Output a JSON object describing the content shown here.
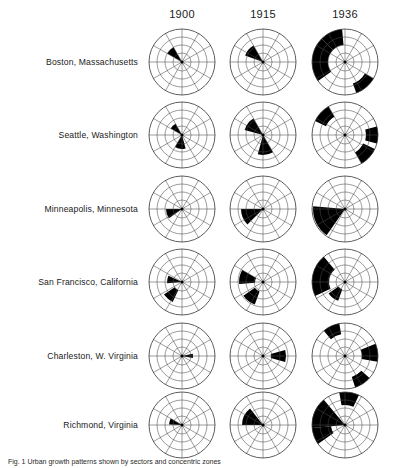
{
  "figure": {
    "title": "",
    "caption": "Fig. 1 Urban growth patterns shown by sectors and concentric zones"
  },
  "columns": [
    {
      "label": "1900",
      "cx": 182
    },
    {
      "label": "1915",
      "cx": 263
    },
    {
      "label": "1936",
      "cx": 345
    }
  ],
  "rows": [
    {
      "label": "Boston, Massachusetts",
      "cy": 62
    },
    {
      "label": "Seattle, Washington",
      "cy": 135
    },
    {
      "label": "Minneapolis, Minnesota",
      "cy": 209
    },
    {
      "label": "San Francisco, California",
      "cy": 282
    },
    {
      "label": "Charleston, W. Virginia",
      "cy": 356
    },
    {
      "label": "Richmond, Virginia",
      "cy": 425
    }
  ],
  "chart_data": {
    "type": "polar_area_grid",
    "rows_label": "City",
    "columns_label": "Year",
    "categories": [
      "1900",
      "1915",
      "1936"
    ],
    "radial_axis": {
      "label": "Distance from center",
      "rings": 4,
      "ring_radii_px": [
        9,
        17,
        25,
        33
      ],
      "outer_radius_px": 33
    },
    "angular_axis": {
      "label": "Compass direction",
      "spokes": 12,
      "spoke_step_degrees": 30,
      "zero_direction": "east"
    },
    "legend": {
      "filled": "built-up area",
      "empty": "undeveloped",
      "position": "none"
    },
    "grid": true,
    "series": [
      {
        "name": "Boston, Massachusetts",
        "cells": [
          {
            "year": "1900",
            "sectors": [
              {
                "a0": 120,
                "a1": 150,
                "r0": 0,
                "r1": 17
              }
            ]
          },
          {
            "year": "1915",
            "sectors": [
              {
                "a0": 120,
                "a1": 160,
                "r0": 0,
                "r1": 19
              }
            ]
          },
          {
            "year": "1936",
            "sectors": [
              {
                "a0": 95,
                "a1": 135,
                "r0": 17,
                "r1": 33
              },
              {
                "a0": 135,
                "a1": 215,
                "r0": 17,
                "r1": 33
              },
              {
                "a0": 290,
                "a1": 330,
                "r0": 23,
                "r1": 33
              }
            ]
          }
        ]
      },
      {
        "name": "Seattle, Washington",
        "cells": [
          {
            "year": "1900",
            "sectors": [
              {
                "a0": 120,
                "a1": 150,
                "r0": 0,
                "r1": 13
              },
              {
                "a0": 240,
                "a1": 285,
                "r0": 0,
                "r1": 14
              }
            ]
          },
          {
            "year": "1915",
            "sectors": [
              {
                "a0": 120,
                "a1": 165,
                "r0": 0,
                "r1": 19
              },
              {
                "a0": 255,
                "a1": 300,
                "r0": 0,
                "r1": 20
              }
            ]
          },
          {
            "year": "1936",
            "sectors": [
              {
                "a0": 120,
                "a1": 155,
                "r0": 21,
                "r1": 33
              },
              {
                "a0": 345,
                "a1": 375,
                "r0": 21,
                "r1": 33
              },
              {
                "a0": 300,
                "a1": 335,
                "r0": 20,
                "r1": 33
              }
            ]
          }
        ]
      },
      {
        "name": "Minneapolis, Minnesota",
        "cells": [
          {
            "year": "1900",
            "sectors": [
              {
                "a0": 180,
                "a1": 215,
                "r0": 0,
                "r1": 16
              }
            ]
          },
          {
            "year": "1915",
            "sectors": [
              {
                "a0": 180,
                "a1": 225,
                "r0": 0,
                "r1": 22
              }
            ]
          },
          {
            "year": "1936",
            "sectors": [
              {
                "a0": 175,
                "a1": 235,
                "r0": 0,
                "r1": 32
              }
            ]
          }
        ]
      },
      {
        "name": "San Francisco, California",
        "cells": [
          {
            "year": "1900",
            "sectors": [
              {
                "a0": 155,
                "a1": 185,
                "r0": 0,
                "r1": 15
              },
              {
                "a0": 215,
                "a1": 245,
                "r0": 9,
                "r1": 22
              }
            ]
          },
          {
            "year": "1915",
            "sectors": [
              {
                "a0": 150,
                "a1": 185,
                "r0": 8,
                "r1": 24
              },
              {
                "a0": 215,
                "a1": 250,
                "r0": 10,
                "r1": 24
              }
            ]
          },
          {
            "year": "1936",
            "sectors": [
              {
                "a0": 130,
                "a1": 205,
                "r0": 16,
                "r1": 33
              },
              {
                "a0": 215,
                "a1": 250,
                "r0": 8,
                "r1": 20
              }
            ]
          }
        ]
      },
      {
        "name": "Charleston, W. Virginia",
        "cells": [
          {
            "year": "1900",
            "sectors": [
              {
                "a0": 350,
                "a1": 372,
                "r0": 0,
                "r1": 11
              }
            ]
          },
          {
            "year": "1915",
            "sectors": [
              {
                "a0": 345,
                "a1": 375,
                "r0": 8,
                "r1": 23
              }
            ]
          },
          {
            "year": "1936",
            "sectors": [
              {
                "a0": 100,
                "a1": 130,
                "r0": 22,
                "r1": 33
              },
              {
                "a0": 350,
                "a1": 382,
                "r0": 17,
                "r1": 33
              },
              {
                "a0": 288,
                "a1": 318,
                "r0": 22,
                "r1": 33
              }
            ]
          }
        ]
      },
      {
        "name": "Richmond, Virginia",
        "cells": [
          {
            "year": "1900",
            "sectors": [
              {
                "a0": 150,
                "a1": 178,
                "r0": 0,
                "r1": 13
              }
            ]
          },
          {
            "year": "1915",
            "sectors": [
              {
                "a0": 128,
                "a1": 180,
                "r0": 0,
                "r1": 21
              }
            ]
          },
          {
            "year": "1936",
            "sectors": [
              {
                "a0": 130,
                "a1": 185,
                "r0": 0,
                "r1": 33
              },
              {
                "a0": 185,
                "a1": 215,
                "r0": 14,
                "r1": 33
              },
              {
                "a0": 65,
                "a1": 100,
                "r0": 20,
                "r1": 33
              }
            ]
          }
        ]
      }
    ]
  }
}
